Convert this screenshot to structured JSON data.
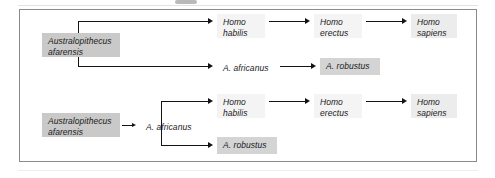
{
  "figure": {
    "kind": "phylogeny-diagram",
    "border_color": "#8a8a93",
    "line_color": "#131313",
    "background": "#ffffff"
  },
  "diagrams": [
    {
      "id": "upper",
      "nodes": {
        "root": {
          "label": "Australopithecus\nafarensis",
          "shade": "#c9c9c9"
        },
        "habilis": {
          "label": "Homo\nhabilis",
          "shade": "#f4f4f4"
        },
        "erectus": {
          "label": "Homo\nerectus",
          "shade": "#f4f4f4"
        },
        "sapiens": {
          "label": "Homo\nsapiens",
          "shade": "#ececec"
        },
        "africanus": {
          "label": "A. africanus",
          "shade": "#fbfbfb"
        },
        "robustus": {
          "label": "A. robustus",
          "shade": "#d4d4d4"
        }
      }
    },
    {
      "id": "lower",
      "nodes": {
        "root": {
          "label": "Australopithecus\nafarensis",
          "shade": "#c9c9c9"
        },
        "africanus": {
          "label": "A. africanus",
          "shade": "#fbfbfb"
        },
        "habilis": {
          "label": "Homo\nhabilis",
          "shade": "#f4f4f4"
        },
        "erectus": {
          "label": "Homo\nerectus",
          "shade": "#f4f4f4"
        },
        "sapiens": {
          "label": "Homo\nsapiens",
          "shade": "#ececec"
        },
        "robustus": {
          "label": "A. robustus",
          "shade": "#d4d4d4"
        }
      }
    }
  ]
}
